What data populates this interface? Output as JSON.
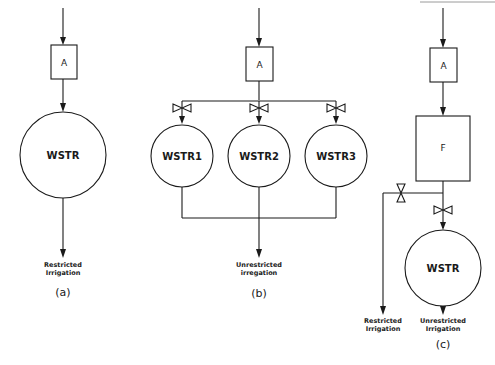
{
  "header": {
    "running_text_fragment": ""
  },
  "panels": {
    "a": {
      "caption": "(a)",
      "treatment_box": "A",
      "reservoir": "WSTR",
      "outputs": [
        "Restricted",
        "Irrigation"
      ]
    },
    "b": {
      "caption": "(b)",
      "treatment_box": "A",
      "reservoirs": [
        "WSTR1",
        "WSTR2",
        "WSTR3"
      ],
      "outputs": [
        "Unrestricted",
        "irregation"
      ],
      "valves": 3
    },
    "c": {
      "caption": "(c)",
      "treatment_box": "A",
      "filter_box": "F",
      "reservoir": "WSTR",
      "outputs_left": [
        "Restricted",
        "Irrigation"
      ],
      "outputs_right": [
        "Unrestricted",
        "Irrigation"
      ],
      "valves": 2
    }
  },
  "colors": {
    "line": "#1a1a1a",
    "background": "#ffffff"
  }
}
